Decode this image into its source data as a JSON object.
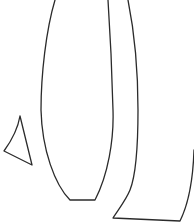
{
  "diagram": {
    "type": "line-drawing",
    "stroke_color": "#2b2b2b",
    "background": "#ffffff",
    "shapes": [
      {
        "name": "tall-curved-shape",
        "description": "vase-like elongated outline with flat bottom"
      },
      {
        "name": "curved-band-shape",
        "description": "curved strip outline extending off right edge"
      },
      {
        "name": "small-triangle",
        "description": "small triangular outline on left"
      }
    ],
    "caption": ""
  }
}
